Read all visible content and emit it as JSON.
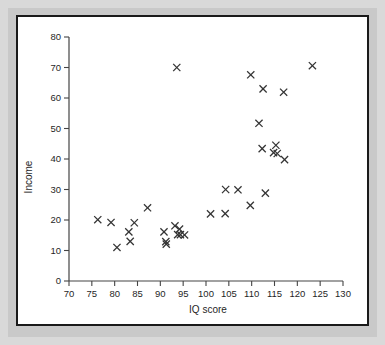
{
  "figure": {
    "background_color": "#d9d9d9",
    "panel_color": "#ffffff",
    "panel_border_color": "#1a1a1a",
    "marker_color": "#333333",
    "axis_color": "#444444"
  },
  "chart_data": {
    "type": "scatter",
    "title": "",
    "xlabel": "IQ score",
    "ylabel": "Income",
    "xlim": [
      70,
      130
    ],
    "ylim": [
      0,
      80
    ],
    "xticks": [
      70,
      75,
      80,
      85,
      90,
      95,
      100,
      105,
      110,
      115,
      120,
      125,
      130
    ],
    "yticks": [
      0,
      10,
      20,
      30,
      40,
      50,
      60,
      70,
      80
    ],
    "xticklabels": [
      "70",
      "75",
      "80",
      "85",
      "90",
      "95",
      "100",
      "105",
      "110",
      "115",
      "120",
      "125",
      "130"
    ],
    "yticklabels": [
      "0",
      "10",
      "20",
      "30",
      "40",
      "50",
      "60",
      "70",
      "80"
    ],
    "grid": false,
    "legend": null,
    "marker": "x",
    "series": [
      {
        "name": "observations",
        "x": [
          76.3,
          79.2,
          80.5,
          83.1,
          83.4,
          84.3,
          87.2,
          90.8,
          91.2,
          91.3,
          93.2,
          93.6,
          93.8,
          94.2,
          94.4,
          95.3,
          101.0,
          104.3,
          104.2,
          107.0,
          109.7,
          109.8,
          111.6,
          112.3,
          112.5,
          113.0,
          114.8,
          115.3,
          115.6,
          117.0,
          117.2,
          123.3
        ],
        "y": [
          20.1,
          19.2,
          11.0,
          16.1,
          13.0,
          19.1,
          24.0,
          16.1,
          12.9,
          12.1,
          18.1,
          70.0,
          15.2,
          17.0,
          15.2,
          15.1,
          22.0,
          30.0,
          22.1,
          29.9,
          24.8,
          67.6,
          51.7,
          43.4,
          63.0,
          28.8,
          42.1,
          44.5,
          41.8,
          61.9,
          39.8,
          70.6
        ]
      }
    ]
  }
}
